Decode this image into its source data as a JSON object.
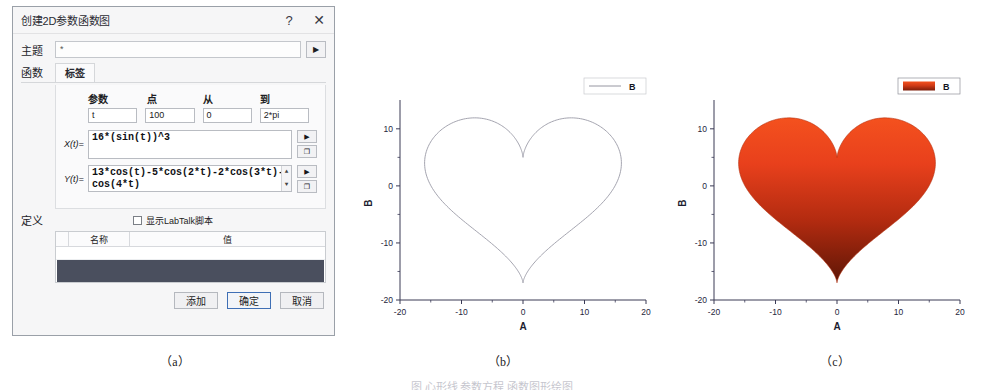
{
  "dialog": {
    "title": "创建2D参数函数图",
    "help_button": "?",
    "close_button": "✕",
    "theme": {
      "label": "主题",
      "value": "*",
      "dropdown_icon": "▶"
    },
    "tabs_left_label": "函数",
    "tabs": [
      {
        "label": "标签",
        "active": true
      }
    ],
    "param_table": {
      "headers": [
        "参数",
        "点",
        "从",
        "到"
      ],
      "values": [
        "t",
        "100",
        "0",
        "2*pi"
      ]
    },
    "functions": [
      {
        "label": "X(t)=",
        "value": "16*(sin(t))^3",
        "run_icon": "▶",
        "copy_icon": "❐"
      },
      {
        "label": "Y(t)=",
        "value": "13*cos(t)-5*cos(2*t)-2*cos(3*t)-cos(4*t)",
        "run_icon": "▶",
        "copy_icon": "❐"
      }
    ],
    "definition": {
      "label": "定义",
      "checkbox_label": "显示LabTalk脚本",
      "checked": false,
      "table_headers": [
        "名称",
        "值"
      ]
    },
    "buttons": [
      {
        "label": "添加",
        "default": false
      },
      {
        "label": "确定",
        "default": true
      },
      {
        "label": "取消",
        "default": false
      }
    ]
  },
  "captions": {
    "a": "（a）",
    "b": "（b）",
    "c": "（c）",
    "figure": "图 心形线 参数方程 函数图形绘图"
  },
  "chart_data": [
    {
      "id": "b",
      "type": "line",
      "title": "",
      "xlabel": "A",
      "ylabel": "B",
      "legend": [
        {
          "name": "B",
          "style": "line",
          "color": "#8a8a96"
        }
      ],
      "legend_position": "top-right",
      "grid": false,
      "xlim": [
        -20,
        20
      ],
      "ylim": [
        -20,
        14
      ],
      "xticks": [
        -20,
        -10,
        0,
        10,
        20
      ],
      "yticks": [
        -20,
        -10,
        0,
        10
      ],
      "curve_color": "#9a9aa6",
      "fill": false,
      "equation": {
        "x": "16*(sin(t))^3",
        "y": "13*cos(t)-5*cos(2*t)-2*cos(3*t)-cos(4*t)",
        "t_from": 0,
        "t_to": 6.2832,
        "points": 100
      },
      "extents": {
        "x_min": -16,
        "x_max": 16,
        "y_min": -17,
        "y_max": 12
      }
    },
    {
      "id": "c",
      "type": "area",
      "title": "",
      "xlabel": "A",
      "ylabel": "B",
      "legend": [
        {
          "name": "B",
          "style": "swatch",
          "color": "#e0421c"
        }
      ],
      "legend_position": "top-right",
      "grid": false,
      "xlim": [
        -20,
        20
      ],
      "ylim": [
        -20,
        14
      ],
      "xticks": [
        -20,
        -10,
        0,
        10,
        20
      ],
      "yticks": [
        -20,
        -10,
        0,
        10
      ],
      "fill": true,
      "fill_gradient": [
        "#f4511e",
        "#e8401c",
        "#b32b10",
        "#6d1a08"
      ],
      "curve_color": "#b5300f",
      "equation": {
        "x": "16*(sin(t))^3",
        "y": "13*cos(t)-5*cos(2*t)-2*cos(3*t)-cos(4*t)",
        "t_from": 0,
        "t_to": 6.2832,
        "points": 100
      },
      "extents": {
        "x_min": -16,
        "x_max": 16,
        "y_min": -17,
        "y_max": 12
      }
    }
  ]
}
